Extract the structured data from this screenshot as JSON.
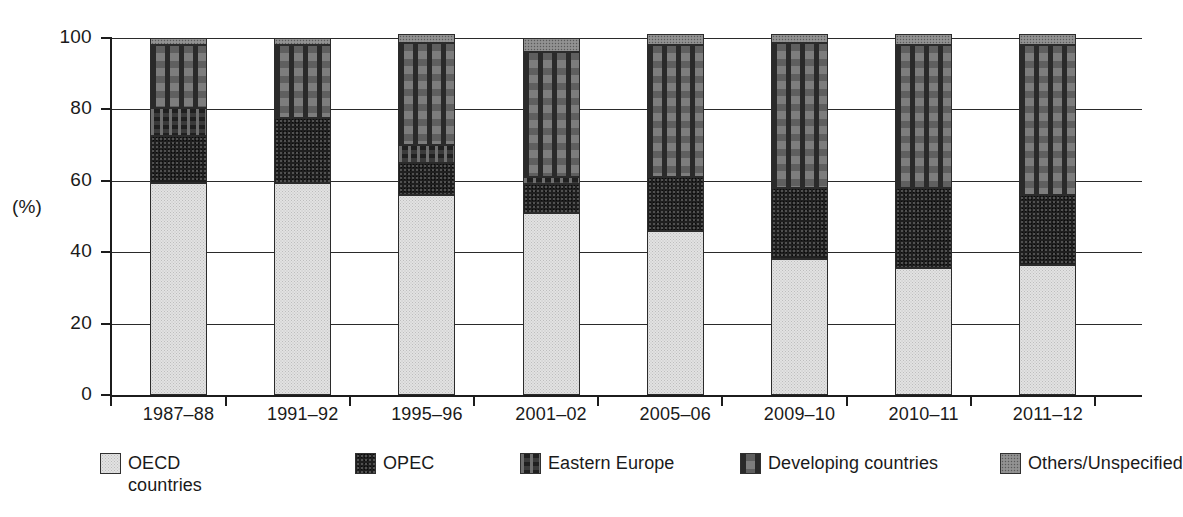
{
  "chart_data": {
    "type": "bar",
    "title": "",
    "subtitle": "",
    "xlabel": "",
    "ylabel": "(%)",
    "ylim": [
      0,
      100
    ],
    "yticks": [
      0,
      20,
      40,
      60,
      80,
      100
    ],
    "ytick_labels": [
      "0",
      "20",
      "40",
      "60",
      "80",
      "100"
    ],
    "grid": true,
    "stacked": true,
    "legend_position": "bottom",
    "categories": [
      "1987–88",
      "1991–92",
      "1995–96",
      "2001–02",
      "2005–06",
      "2009–10",
      "2010–11",
      "2011–12"
    ],
    "series": [
      {
        "name": "OECD\ncountries",
        "legend_label": "OECD\ncountries",
        "pattern": "light-stipple",
        "color": "#e2e2e2",
        "values": [
          59.5,
          59.5,
          56.0,
          51.0,
          46.0,
          38.0,
          35.5,
          36.5
        ]
      },
      {
        "name": "OPEC",
        "legend_label": "OPEC",
        "pattern": "black-speckle",
        "color": "#1f1f1f",
        "values": [
          13.0,
          18.0,
          9.0,
          8.0,
          15.0,
          20.0,
          22.5,
          19.5
        ]
      },
      {
        "name": "Eastern Europe",
        "legend_label": "Eastern Europe",
        "pattern": "dark-dash",
        "color": "#3a3a3a",
        "values": [
          8.0,
          0.0,
          5.0,
          2.0,
          0.0,
          0.0,
          0.0,
          0.0
        ]
      },
      {
        "name": "Developing countries",
        "legend_label": "Developing countries",
        "pattern": "mid-dash",
        "color": "#7d7d7d",
        "values": [
          17.5,
          20.5,
          28.5,
          35.0,
          37.0,
          40.5,
          40.0,
          42.0
        ]
      },
      {
        "name": "Others/Unspecified",
        "legend_label": "Others/Unspecified",
        "pattern": "mid-stipple",
        "color": "#8a8a8a",
        "values": [
          2.0,
          2.0,
          2.5,
          4.0,
          3.0,
          2.5,
          3.0,
          3.0
        ]
      }
    ]
  },
  "legend": {
    "items": [
      {
        "label": "OECD\ncountries",
        "swatch": "pat-oecd"
      },
      {
        "label": "OPEC",
        "swatch": "pat-opec"
      },
      {
        "label": "Eastern Europe",
        "swatch": "pat-eeurope"
      },
      {
        "label": "Developing countries",
        "swatch": "pat-developing"
      },
      {
        "label": "Others/Unspecified",
        "swatch": "pat-others"
      }
    ]
  },
  "axis": {
    "y_title": "(%)"
  }
}
